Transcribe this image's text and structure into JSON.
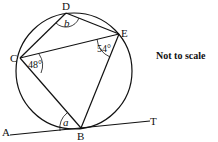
{
  "diagram": {
    "note": "Not to scale",
    "points": {
      "A": {
        "label": "A",
        "x": 10,
        "y": 135
      },
      "B": {
        "label": "B",
        "x": 81,
        "y": 128
      },
      "C": {
        "label": "C",
        "x": 20,
        "y": 58
      },
      "D": {
        "label": "D",
        "x": 66,
        "y": 13
      },
      "E": {
        "label": "E",
        "x": 119,
        "y": 34
      },
      "T": {
        "label": "T",
        "x": 150,
        "y": 121
      }
    },
    "circle": {
      "cx": 74,
      "cy": 71,
      "r": 58
    },
    "angles": {
      "BCE": "48°",
      "CEB": "54°",
      "CDE": "b",
      "ABC": "a"
    },
    "segments": [
      "CD",
      "DE",
      "CE",
      "CB",
      "EB",
      "AT"
    ]
  }
}
